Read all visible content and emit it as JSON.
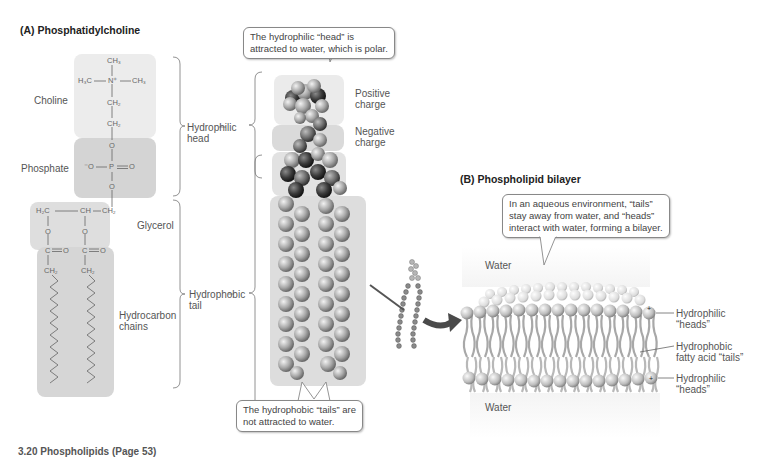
{
  "panel_a": {
    "title": "(A)  Phosphatidylcholine",
    "groups": {
      "choline": "Choline",
      "phosphate": "Phosphate",
      "glycerol": "Glycerol",
      "hydrocarbon_line1": "Hydrocarbon",
      "hydrocarbon_line2": "chains"
    },
    "chem": {
      "ch3_top": "CH₃",
      "h3c": "H₃C",
      "n_plus": "N⁺",
      "ch3_right": "CH₃",
      "ch2_a": "CH₂",
      "ch2_b": "CH₂",
      "o_1": "O",
      "o_minus": "⁻O",
      "p": "P",
      "o_double": "O",
      "o_2": "O",
      "h2c": "H₂C",
      "ch": "CH",
      "ch2_glyc": "CH₂",
      "o_left": "O",
      "o_right": "O",
      "c_left": "C",
      "c_right": "C",
      "o_dbl_left": "O",
      "o_dbl_right": "O",
      "ch2_chain_left": "CH₂",
      "ch2_chain_right": "CH₂"
    },
    "brackets": {
      "hydrophilic_line1": "Hydrophilic",
      "hydrophilic_line2": "head",
      "hydrophobic_line1": "Hydrophobic",
      "hydrophobic_line2": "tail"
    },
    "model_labels": {
      "positive_line1": "Positive",
      "positive_line2": "charge",
      "negative_line1": "Negative",
      "negative_line2": "charge"
    },
    "callout_head": {
      "line1": "The hydrophilic “head” is",
      "line2": "attracted to water, which is polar."
    },
    "callout_tail": {
      "line1": "The hydrophobic “tails” are",
      "line2": "not attracted to water."
    }
  },
  "panel_b": {
    "title": "(B)  Phospholipid bilayer",
    "callout": {
      "line1": "In an aqueous environment, “tails”",
      "line2": "stay away from water, and “heads”",
      "line3": "interact with water, forming a bilayer."
    },
    "water_top": "Water",
    "water_bottom": "Water",
    "labels": {
      "heads_top_line1": "Hydrophilic",
      "heads_top_line2": "“heads”",
      "tails_line1": "Hydrophobic",
      "tails_line2": "fatty acid “tails”",
      "heads_bottom_line1": "Hydrophilic",
      "heads_bottom_line2": "“heads”"
    }
  },
  "colors": {
    "choline_box": "#ececec",
    "phosphate_box": "#d4d4d4",
    "glycerol_box": "#dedede",
    "chain_box": "#d6d6d6",
    "model_bg": "#e2e2e2",
    "atom_light": "#c8c8c8",
    "atom_dark": "#404040",
    "arrow": "#4a4a4a"
  },
  "caption_clipped": "3.20  Phospholipids  (Page 53)"
}
